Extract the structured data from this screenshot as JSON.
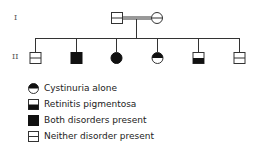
{
  "generations": [
    {
      "label": "I"
    },
    {
      "label": "II"
    }
  ],
  "pedigree": {
    "generation_I": [
      {
        "sex": "male",
        "status": "neither"
      },
      {
        "sex": "female",
        "status": "neither"
      }
    ],
    "generation_II": [
      {
        "sex": "male",
        "status": "neither"
      },
      {
        "sex": "male",
        "status": "both"
      },
      {
        "sex": "female",
        "status": "both"
      },
      {
        "sex": "female",
        "status": "cystinuria"
      },
      {
        "sex": "male",
        "status": "retinitis"
      },
      {
        "sex": "male",
        "status": "neither"
      }
    ]
  },
  "legend": [
    {
      "key": "cystinuria",
      "label": "Cystinuria alone"
    },
    {
      "key": "retinitis",
      "label": "Retinitis pigmentosa"
    },
    {
      "key": "both",
      "label": "Both disorders present"
    },
    {
      "key": "neither",
      "label": "Neither disorder present"
    }
  ],
  "colors": {
    "line": "#333333",
    "fill": "#111111"
  }
}
